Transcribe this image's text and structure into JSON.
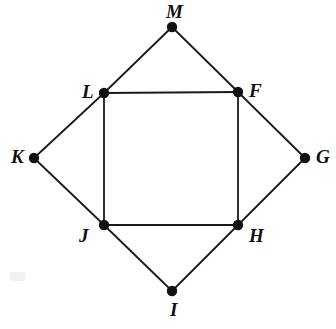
{
  "figure": {
    "background_color": "#ffffff",
    "stroke_color": "#1a1a1a",
    "point_color": "#111111",
    "label_color": "#111111",
    "width": 336,
    "height": 329,
    "stroke_width": 1.8,
    "point_radius": 5.2
  },
  "points": [
    {
      "id": "M",
      "label": "M",
      "x": 172,
      "y": 27,
      "label_x": 166,
      "label_y": 2,
      "label_position": "above"
    },
    {
      "id": "L",
      "label": "L",
      "x": 104,
      "y": 93,
      "label_x": 82,
      "label_y": 82,
      "label_position": "left"
    },
    {
      "id": "F",
      "label": "F",
      "x": 238,
      "y": 92,
      "label_x": 249,
      "label_y": 81,
      "label_position": "right"
    },
    {
      "id": "K",
      "label": "K",
      "x": 34,
      "y": 158,
      "label_x": 11,
      "label_y": 147,
      "label_position": "left"
    },
    {
      "id": "G",
      "label": "G",
      "x": 305,
      "y": 158,
      "label_x": 316,
      "label_y": 147,
      "label_position": "right"
    },
    {
      "id": "J",
      "label": "J",
      "x": 104,
      "y": 225,
      "label_x": 79,
      "label_y": 226,
      "label_position": "below-left"
    },
    {
      "id": "H",
      "label": "H",
      "x": 238,
      "y": 225,
      "label_x": 249,
      "label_y": 226,
      "label_position": "below-right"
    },
    {
      "id": "I",
      "label": "I",
      "x": 172,
      "y": 291,
      "label_x": 170,
      "label_y": 300,
      "label_position": "below"
    }
  ],
  "edges": [
    {
      "id": "KL",
      "from": "K",
      "to": "L",
      "part_of": "outer-rhombus"
    },
    {
      "id": "LM",
      "from": "L",
      "to": "M",
      "part_of": "outer-rhombus"
    },
    {
      "id": "MF",
      "from": "M",
      "to": "F",
      "part_of": "outer-rhombus"
    },
    {
      "id": "FG",
      "from": "F",
      "to": "G",
      "part_of": "outer-rhombus"
    },
    {
      "id": "GH",
      "from": "G",
      "to": "H",
      "part_of": "outer-rhombus"
    },
    {
      "id": "HI",
      "from": "H",
      "to": "I",
      "part_of": "outer-rhombus"
    },
    {
      "id": "IJ",
      "from": "I",
      "to": "J",
      "part_of": "outer-rhombus"
    },
    {
      "id": "JK",
      "from": "J",
      "to": "K",
      "part_of": "outer-rhombus"
    },
    {
      "id": "LF",
      "from": "L",
      "to": "F",
      "part_of": "inner-square"
    },
    {
      "id": "FH",
      "from": "F",
      "to": "H",
      "part_of": "inner-square"
    },
    {
      "id": "HJ",
      "from": "H",
      "to": "J",
      "part_of": "inner-square"
    },
    {
      "id": "JL",
      "from": "J",
      "to": "L",
      "part_of": "inner-square"
    }
  ],
  "artifacts": [
    {
      "id": "scan-smudge",
      "x": 10,
      "y": 272,
      "width": 15,
      "height": 9,
      "color": "#f2f2f2"
    }
  ]
}
